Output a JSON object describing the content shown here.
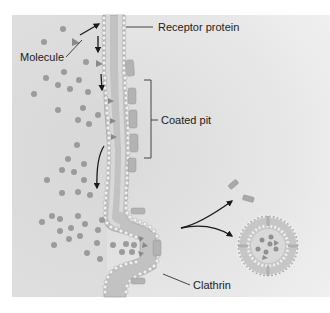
{
  "figure": {
    "topic": "Receptor-mediated endocytosis",
    "colors": {
      "background_panel": "#dedede",
      "molecule": "#9a9a9a",
      "membrane_fill": "#c4c4c4",
      "membrane_head": "#eeeeee",
      "membrane_head_stroke": "#a8a8a8",
      "receptor": "#8e8e8e",
      "clathrin": "#b0b0b0",
      "arrow": "#1a1a1a",
      "label_line": "#333333"
    }
  },
  "labels": {
    "receptor_protein": "Receptor protein",
    "molecule": "Molecule",
    "coated_pit": "Coated pit",
    "clathrin": "Clathrin"
  }
}
